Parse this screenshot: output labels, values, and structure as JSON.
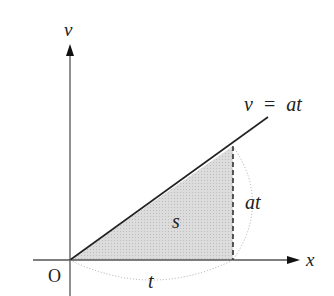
{
  "diagram": {
    "axes": {
      "y_label": "v",
      "x_label": "x",
      "origin_label": "O"
    },
    "line": {
      "equation_left": "v",
      "equation_eq": "=",
      "equation_right": "at"
    },
    "area": {
      "label": "s",
      "fill": "#d9d9d9"
    },
    "height_label": "at",
    "base_label": "t",
    "colors": {
      "axis": "#555555",
      "line": "#222222",
      "dotted": "#aaaaaa"
    }
  }
}
